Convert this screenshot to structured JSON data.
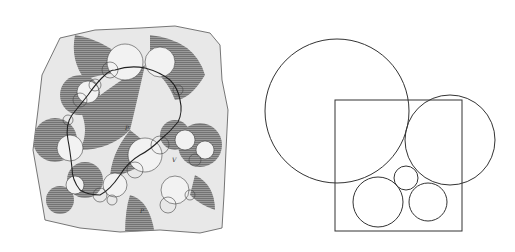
{
  "figure": {
    "panels": [
      {
        "id": "left",
        "description": "Engraved illustration of a Kleinian/limit-set style circle packing with shaded (hatched) lobes and a wandering fractal curve",
        "labels": [
          "P",
          "V",
          "P"
        ],
        "colors": {
          "paper": "#ffffff",
          "sheet": "#e6e6e6",
          "hatch": "#8a8a8a",
          "ink": "#2a2a2a"
        }
      },
      {
        "id": "right",
        "description": "Line diagram: a square with five circles — one large circle upper-left, one circle right, and three small mutually tangent circles at the bottom",
        "shapes": {
          "square": {
            "x": 335,
            "y": 100,
            "w": 127,
            "h": 131
          },
          "circles": [
            {
              "name": "large",
              "cx": 337,
              "cy": 111,
              "r": 72
            },
            {
              "name": "right",
              "cx": 450,
              "cy": 140,
              "r": 45
            },
            {
              "name": "bottom-left",
              "cx": 378,
              "cy": 202,
              "r": 25
            },
            {
              "name": "small-top",
              "cx": 406,
              "cy": 178,
              "r": 12
            },
            {
              "name": "bottom-right",
              "cx": 428,
              "cy": 202,
              "r": 19
            }
          ],
          "stroke": "#333333"
        }
      }
    ]
  }
}
